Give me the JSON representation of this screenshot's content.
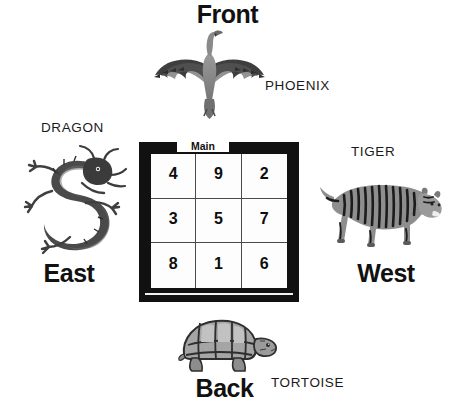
{
  "diagram": {
    "center": {
      "notch_label": "Main",
      "grid_rows": [
        [
          "4",
          "9",
          "2"
        ],
        [
          "3",
          "5",
          "7"
        ],
        [
          "8",
          "1",
          "6"
        ]
      ]
    },
    "directions": {
      "front": "Front",
      "east": "East",
      "west": "West",
      "back": "Back"
    },
    "creatures": {
      "phoenix": "PHOENIX",
      "dragon": "DRAGON",
      "tiger": "TIGER",
      "tortoise": "TORTOISE"
    },
    "colors": {
      "background": "#ffffff",
      "frame": "#111111",
      "grid_line": "#4a4a4a",
      "text": "#111111",
      "artwork_dark": "#3a3a3a",
      "artwork_mid": "#6e6e6e",
      "artwork_light": "#a8a8a8"
    }
  }
}
